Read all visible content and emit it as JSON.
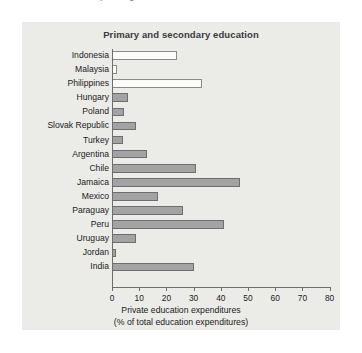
{
  "caption": {
    "text": "FIGURE 3.5   Private spending on education."
  },
  "chart_data": {
    "type": "bar",
    "orientation": "horizontal",
    "title": "Primary and secondary education",
    "xlabel_line1": "Private education expenditures",
    "xlabel_line2": "(% of total education expenditures)",
    "ylabel": "",
    "xlim": [
      0,
      80
    ],
    "xticks": [
      0,
      10,
      20,
      30,
      40,
      50,
      60,
      70,
      80
    ],
    "xtick_labels": [
      "0",
      "10",
      "20",
      "30",
      "40",
      "50",
      "60",
      "70",
      "80"
    ],
    "grid": false,
    "legend": "none",
    "categories": [
      "Indonesia",
      "Malaysia",
      "Philippines",
      "Hungary",
      "Poland",
      "Slovak Republic",
      "Turkey",
      "Argentina",
      "Chile",
      "Jamaica",
      "Mexico",
      "Paraguay",
      "Peru",
      "Uruguay",
      "Jordan",
      "India"
    ],
    "values": [
      24,
      2,
      33,
      6,
      4.5,
      9,
      4,
      13,
      31,
      47,
      17,
      26,
      41,
      9,
      1.5,
      30
    ],
    "bar_styles": [
      "hollow",
      "hollow",
      "hollow",
      "filled",
      "filled",
      "filled",
      "filled",
      "filled",
      "filled",
      "filled",
      "filled",
      "filled",
      "filled",
      "filled",
      "filled",
      "filled"
    ]
  },
  "colors": {
    "panel_background": "#ebebe8",
    "page_background": "#ffffff",
    "bar_fill": "#a3a3a3",
    "bar_hollow_fill": "#fbfbfa",
    "bar_border": "#6e6e6e",
    "axis": "#6d6d6d",
    "text": "#1b1b1b",
    "title_text": "#3a3a3a"
  }
}
